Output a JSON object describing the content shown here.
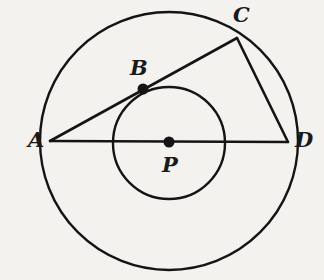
{
  "figure": {
    "background_color": "#f4f2ef",
    "stroke_color": "#141414",
    "labels": {
      "a": "A",
      "b": "B",
      "c": "C",
      "d": "D",
      "p": "P"
    }
  },
  "chart_data": {
    "type": "diagram",
    "xlabel": "",
    "ylabel": "",
    "coordinate_space": {
      "width": 324,
      "height": 280,
      "y_axis": "down"
    },
    "center": {
      "label": "P",
      "x": 169,
      "y": 142
    },
    "circles": [
      {
        "name": "outer-circle",
        "cx": 169,
        "cy": 141,
        "r": 129,
        "stroke": "#141414",
        "stroke_width": 2.4,
        "fill": "none"
      },
      {
        "name": "inner-circle",
        "cx": 169,
        "cy": 143,
        "r": 56,
        "stroke": "#141414",
        "stroke_width": 2.4,
        "fill": "none"
      }
    ],
    "points": [
      {
        "label": "A",
        "x": 50,
        "y": 141,
        "on": "outer-circle",
        "dot": false,
        "label_x": 28,
        "label_y": 129
      },
      {
        "label": "B",
        "x": 143,
        "y": 89,
        "on": "inner-circle",
        "dot": true,
        "dot_r": 5.5,
        "label_x": 130,
        "label_y": 57
      },
      {
        "label": "C",
        "x": 237,
        "y": 38,
        "on": "outer-circle",
        "dot": false,
        "label_x": 233,
        "label_y": 4
      },
      {
        "label": "D",
        "x": 288,
        "y": 142,
        "on": "outer-circle",
        "dot": false,
        "label_x": 295,
        "label_y": 129
      },
      {
        "label": "P",
        "x": 169,
        "y": 142,
        "on": "center",
        "dot": true,
        "dot_r": 5.5,
        "label_x": 162,
        "label_y": 154
      }
    ],
    "segments": [
      {
        "name": "segment-AD",
        "from": "A",
        "to": "D",
        "x1": 50,
        "y1": 141,
        "x2": 288,
        "y2": 142,
        "note": "diameter through center P"
      },
      {
        "name": "segment-AC",
        "from": "A",
        "to": "C",
        "x1": 50,
        "y1": 141,
        "x2": 237,
        "y2": 38,
        "note": "chord tangent-crossing inner circle at B"
      },
      {
        "name": "segment-CD",
        "from": "C",
        "to": "D",
        "x1": 237,
        "y1": 38,
        "x2": 288,
        "y2": 142,
        "note": "chord"
      }
    ],
    "legend": [],
    "annotations": [
      "A, C and D lie on the outer circle",
      "B lies on the inner circle and on segment AC",
      "P is the common center of both circles",
      "AD is a diameter of the outer circle"
    ]
  }
}
